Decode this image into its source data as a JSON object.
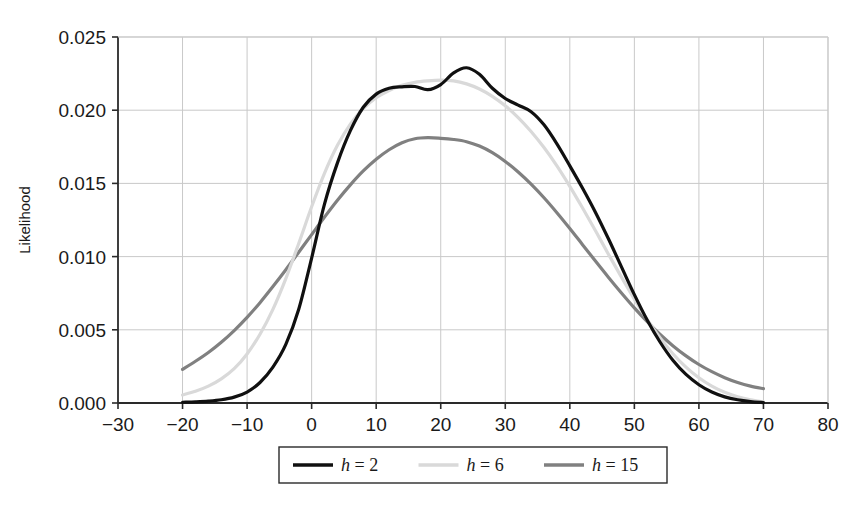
{
  "chart_data": {
    "type": "line",
    "title": "",
    "subtitle": "",
    "xlabel": "",
    "ylabel": "Likelihood",
    "xlim": [
      -30,
      80
    ],
    "ylim": [
      0.0,
      0.025
    ],
    "xticks": [
      -30,
      -20,
      -10,
      0,
      10,
      20,
      30,
      40,
      50,
      60,
      70,
      80
    ],
    "xtick_labels": [
      "−30",
      "−20",
      "−10",
      "0",
      "10",
      "20",
      "30",
      "40",
      "50",
      "60",
      "70",
      "80"
    ],
    "yticks": [
      0.0,
      0.005,
      0.01,
      0.015,
      0.02,
      0.025
    ],
    "ytick_labels": [
      "0.000",
      "0.005",
      "0.010",
      "0.015",
      "0.020",
      "0.025"
    ],
    "grid": true,
    "grid_color": "#c9c9c9",
    "background": "#ffffff",
    "legend_position": "below-center",
    "legend_entries": [
      "h = 2",
      "h = 6",
      "h = 15"
    ],
    "x": [
      -20,
      -18,
      -16,
      -14,
      -12,
      -10,
      -8,
      -6,
      -4,
      -2,
      0,
      2,
      4,
      6,
      8,
      10,
      12,
      14,
      16,
      18,
      20,
      22,
      24,
      26,
      28,
      30,
      32,
      34,
      36,
      38,
      40,
      42,
      44,
      46,
      48,
      50,
      52,
      54,
      56,
      58,
      60,
      62,
      64,
      66,
      68,
      70
    ],
    "series": [
      {
        "name": "h = 2",
        "color": "#101010",
        "width": 3.2,
        "values": [
          5e-05,
          8e-05,
          0.00013,
          0.00022,
          0.0004,
          0.00075,
          0.0014,
          0.00245,
          0.004,
          0.0064,
          0.0099,
          0.0136,
          0.0164,
          0.0186,
          0.0202,
          0.0211,
          0.0215,
          0.0216,
          0.02162,
          0.0214,
          0.02175,
          0.02255,
          0.0229,
          0.02245,
          0.0215,
          0.0208,
          0.02035,
          0.0199,
          0.019,
          0.0177,
          0.0162,
          0.01465,
          0.013,
          0.0112,
          0.0093,
          0.0074,
          0.00565,
          0.00415,
          0.0029,
          0.00195,
          0.00125,
          0.00075,
          0.00042,
          0.00022,
          0.0001,
          3e-05
        ]
      },
      {
        "name": "h = 6",
        "color": "#d9d9d9",
        "width": 3.2,
        "values": [
          0.00055,
          0.0008,
          0.00115,
          0.00165,
          0.00235,
          0.00335,
          0.0047,
          0.0064,
          0.0085,
          0.0109,
          0.0134,
          0.0157,
          0.0176,
          0.01905,
          0.0201,
          0.02085,
          0.02135,
          0.0217,
          0.0219,
          0.022,
          0.02205,
          0.022,
          0.0218,
          0.02145,
          0.02095,
          0.0203,
          0.0195,
          0.01855,
          0.01745,
          0.0162,
          0.0148,
          0.0133,
          0.01175,
          0.01015,
          0.0086,
          0.0071,
          0.0057,
          0.00445,
          0.00335,
          0.00245,
          0.00172,
          0.00115,
          0.00073,
          0.00043,
          0.00022,
          8e-05
        ]
      },
      {
        "name": "h = 15",
        "color": "#808080",
        "width": 3.2,
        "values": [
          0.0023,
          0.00285,
          0.00345,
          0.00415,
          0.00495,
          0.00585,
          0.00685,
          0.00795,
          0.0091,
          0.0103,
          0.0115,
          0.0127,
          0.01385,
          0.0149,
          0.01585,
          0.01665,
          0.0173,
          0.01778,
          0.01805,
          0.01812,
          0.01808,
          0.018,
          0.01785,
          0.01755,
          0.0171,
          0.0165,
          0.01578,
          0.01495,
          0.01402,
          0.013,
          0.01192,
          0.0108,
          0.00968,
          0.00858,
          0.00752,
          0.0065,
          0.00555,
          0.00468,
          0.0039,
          0.00322,
          0.00263,
          0.00214,
          0.00173,
          0.0014,
          0.00115,
          0.00098
        ]
      }
    ]
  },
  "axes": {
    "ylabel": "Likelihood"
  },
  "legend": {
    "items": [
      {
        "label_var": "h",
        "label_eq": " = ",
        "label_val": "2",
        "color": "#101010"
      },
      {
        "label_var": "h",
        "label_eq": " = ",
        "label_val": "6",
        "color": "#d9d9d9"
      },
      {
        "label_var": "h",
        "label_eq": " = ",
        "label_val": "15",
        "color": "#808080"
      }
    ]
  }
}
